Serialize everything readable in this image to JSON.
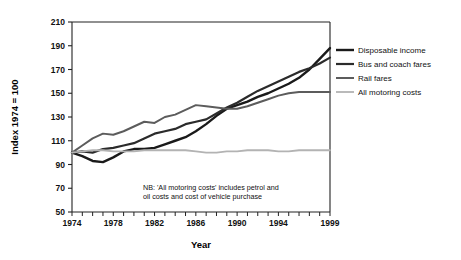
{
  "chart_data": {
    "type": "line",
    "title": "",
    "xlabel": "Year",
    "ylabel": "Index 1974 = 100",
    "xlim": [
      1974,
      1999
    ],
    "ylim": [
      50,
      210
    ],
    "ytick_step": 20,
    "yticks": [
      50,
      70,
      90,
      110,
      130,
      150,
      170,
      190,
      210
    ],
    "xticks_major": [
      1974,
      1978,
      1982,
      1986,
      1990,
      1994,
      1999
    ],
    "xticks_all": [
      1974,
      1975,
      1976,
      1977,
      1978,
      1979,
      1980,
      1981,
      1982,
      1983,
      1984,
      1985,
      1986,
      1987,
      1988,
      1989,
      1990,
      1991,
      1992,
      1993,
      1994,
      1995,
      1996,
      1997,
      1998,
      1999
    ],
    "grid": false,
    "legend_position": "right",
    "x": [
      1974,
      1975,
      1976,
      1977,
      1978,
      1979,
      1980,
      1981,
      1982,
      1983,
      1984,
      1985,
      1986,
      1987,
      1988,
      1989,
      1990,
      1991,
      1992,
      1993,
      1994,
      1995,
      1996,
      1997,
      1998,
      1999
    ],
    "series": [
      {
        "name": "Disposable income",
        "color": "#1a1a1a",
        "width": 2.4,
        "values": [
          100,
          97,
          93,
          92,
          96,
          101,
          103,
          103,
          104,
          107,
          110,
          113,
          118,
          124,
          131,
          137,
          140,
          143,
          147,
          150,
          154,
          158,
          163,
          170,
          179,
          188
        ]
      },
      {
        "name": "Bus and coach fares",
        "color": "#2b2b2b",
        "width": 2.2,
        "values": [
          100,
          101,
          100,
          103,
          104,
          106,
          108,
          112,
          116,
          118,
          120,
          124,
          126,
          128,
          133,
          138,
          142,
          147,
          152,
          156,
          160,
          164,
          168,
          171,
          175,
          180
        ]
      },
      {
        "name": "Rail fares",
        "color": "#5c5c5c",
        "width": 2.0,
        "values": [
          100,
          106,
          112,
          116,
          115,
          118,
          122,
          126,
          125,
          130,
          132,
          136,
          140,
          139,
          138,
          137,
          137,
          139,
          142,
          145,
          148,
          150,
          151,
          151,
          151,
          151
        ]
      },
      {
        "name": "All motoring costs",
        "color": "#b3b3b3",
        "width": 1.8,
        "values": [
          100,
          101,
          102,
          102,
          101,
          101,
          101,
          102,
          102,
          102,
          102,
          102,
          101,
          100,
          100,
          101,
          101,
          102,
          102,
          102,
          101,
          101,
          102,
          102,
          102,
          102
        ]
      }
    ],
    "annotations": [
      "NB: 'All motoring costs' includes petrol and",
      "oil costs and cost of vehicle purchase"
    ]
  },
  "legend": {
    "items": [
      {
        "label": "Disposable income"
      },
      {
        "label": "Bus and coach fares"
      },
      {
        "label": "Rail fares"
      },
      {
        "label": "All motoring costs"
      }
    ]
  }
}
